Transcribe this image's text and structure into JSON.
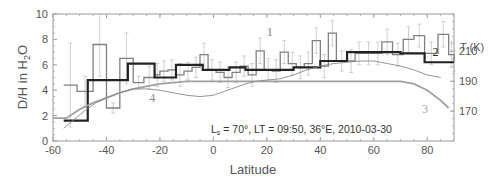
{
  "chart_data": {
    "type": "line",
    "title": "",
    "xlabel": "Latitude",
    "ylabel": "D/H in H2O",
    "ylabel_parts": {
      "main": "D/H in H",
      "sub": "2",
      "tail": "O"
    },
    "y2label": "T (K)",
    "xlim": [
      -60,
      90
    ],
    "ylim": [
      0,
      10
    ],
    "y2lim": [
      150,
      235
    ],
    "x_ticks": [
      -60,
      -40,
      -20,
      0,
      20,
      40,
      60,
      80
    ],
    "y_ticks": [
      0,
      2,
      4,
      6,
      8,
      10
    ],
    "y2_ticks": [
      170,
      190,
      210
    ],
    "grid": false,
    "annotation": {
      "prefix": "L",
      "sub": "s",
      "text": " = 70°, LT = 09:50, 36°E, 2010-03-30"
    },
    "series": [
      {
        "name": "1",
        "label": "1",
        "style": "step-thin-gray",
        "color": "#808080",
        "edges": [
          -56,
          -51,
          -45,
          -40,
          -35,
          -30,
          -26,
          -22,
          -20,
          -17,
          -14,
          -11,
          -8,
          -5,
          -2,
          1,
          4,
          7,
          10,
          13,
          16,
          19,
          22,
          25,
          28,
          31,
          34,
          37,
          40,
          43,
          46,
          50,
          53,
          56,
          60,
          63,
          67,
          71,
          75,
          79,
          84,
          88,
          90
        ],
        "values": [
          4.4,
          3.9,
          7.6,
          2.6,
          6.5,
          4.6,
          5.0,
          5.2,
          5.5,
          5.6,
          5.2,
          5.5,
          5.8,
          6.8,
          5.6,
          5.4,
          5.0,
          5.4,
          5.9,
          5.2,
          7.1,
          5.6,
          5.5,
          7.0,
          6.1,
          5.8,
          6.1,
          7.9,
          5.9,
          8.5,
          6.3,
          6.3,
          6.9,
          6.9,
          6.9,
          7.8,
          6.8,
          8.0,
          8.3,
          6.9,
          8.4,
          6.8,
          6.3
        ],
        "errors": [
          3.3,
          1.2,
          2.5,
          0.4,
          2.0,
          0.5,
          0.9,
          0.9,
          0.8,
          0.8,
          0.9,
          0.7,
          0.8,
          0.9,
          0.8,
          0.8,
          0.8,
          0.8,
          0.8,
          0.9,
          1.0,
          0.9,
          0.9,
          0.9,
          0.9,
          0.9,
          0.9,
          1.0,
          0.9,
          1.0,
          0.8,
          0.9,
          0.9,
          0.9,
          0.9,
          1.0,
          0.9,
          1.0,
          0.9,
          0.9,
          1.0,
          1.0,
          0.8
        ]
      },
      {
        "name": "2",
        "label": "2",
        "style": "step-thick-dark",
        "color": "#222222",
        "edges": [
          -56,
          -47,
          -32,
          -22,
          -14,
          -4,
          6,
          12,
          20,
          30,
          40,
          50,
          60,
          70,
          79,
          90
        ],
        "values": [
          1.6,
          4.8,
          6.1,
          5.0,
          6.0,
          5.6,
          5.8,
          5.6,
          5.6,
          5.8,
          6.3,
          7.0,
          7.0,
          6.9,
          6.2,
          6.2
        ]
      },
      {
        "name": "3",
        "label": "3",
        "style": "curve-gray",
        "color": "#a0a0a0",
        "x": [
          -60,
          -55,
          -50,
          -45,
          -40,
          -35,
          -30,
          -25,
          -20,
          -15,
          -10,
          -5,
          0,
          10,
          20,
          30,
          40,
          50,
          60,
          70,
          75,
          80,
          85,
          88
        ],
        "values": [
          1.8,
          1.8,
          2.5,
          3.0,
          3.4,
          3.8,
          4.1,
          4.3,
          4.5,
          4.6,
          4.7,
          4.7,
          4.7,
          4.7,
          4.7,
          4.7,
          4.7,
          4.7,
          4.7,
          4.7,
          4.5,
          4.0,
          3.2,
          2.6
        ]
      },
      {
        "name": "4",
        "label": "4",
        "style": "curve-thin-gray",
        "color": "#888888",
        "x": [
          -56,
          -52,
          -48,
          -44,
          -40,
          -35,
          -30,
          -25,
          -20,
          -15,
          -10,
          -5,
          0,
          4,
          8,
          12,
          16,
          20,
          25,
          30,
          35,
          40,
          45,
          50,
          55,
          60,
          65,
          70,
          75,
          80,
          85
        ],
        "values": [
          1.0,
          1.7,
          2.4,
          3.0,
          3.4,
          3.8,
          4.1,
          4.1,
          4.0,
          3.8,
          3.6,
          3.5,
          3.6,
          3.9,
          4.2,
          4.5,
          4.7,
          4.8,
          4.9,
          5.2,
          5.6,
          5.9,
          6.1,
          6.2,
          6.3,
          6.3,
          6.1,
          5.9,
          5.6,
          5.2,
          5.0
        ]
      }
    ],
    "series_label_positions": {
      "1": {
        "x": 20,
        "y": 8.3
      },
      "2": {
        "x": 82,
        "y": 6.7
      },
      "3": {
        "x": 78,
        "y": 2.2
      },
      "4": {
        "x": -24,
        "y": 3.1
      }
    }
  }
}
